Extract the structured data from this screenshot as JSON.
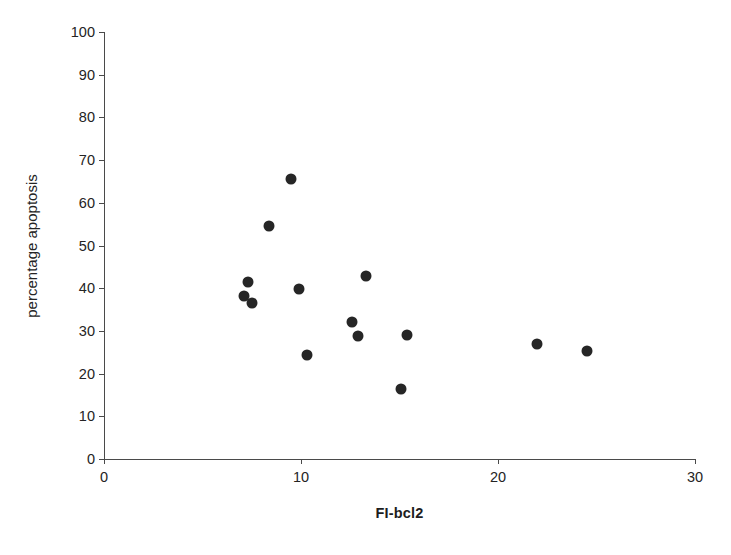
{
  "chart_data": {
    "type": "scatter",
    "title": "",
    "xlabel": "FI-bcl2",
    "ylabel": "percentage apoptosis",
    "xlim": [
      0,
      30
    ],
    "ylim": [
      0,
      100
    ],
    "xticks": [
      0,
      10,
      20,
      30
    ],
    "yticks": [
      0,
      10,
      20,
      30,
      40,
      50,
      60,
      70,
      80,
      90,
      100
    ],
    "xtick_labels": [
      "0",
      "10",
      "20",
      "30"
    ],
    "ytick_labels": [
      "0",
      "10",
      "20",
      "30",
      "40",
      "50",
      "60",
      "70",
      "80",
      "90",
      "100"
    ],
    "grid": false,
    "legend": false,
    "marker": "filled-circle",
    "marker_color": "#262626",
    "axis_color": "#4a4a4a",
    "series": [
      {
        "name": "samples",
        "points": [
          {
            "x": 7.3,
            "y": 41.5
          },
          {
            "x": 7.1,
            "y": 38.2
          },
          {
            "x": 7.5,
            "y": 36.6
          },
          {
            "x": 8.4,
            "y": 54.6
          },
          {
            "x": 9.5,
            "y": 65.5
          },
          {
            "x": 9.9,
            "y": 39.8
          },
          {
            "x": 10.3,
            "y": 24.4
          },
          {
            "x": 12.6,
            "y": 32.1
          },
          {
            "x": 12.9,
            "y": 28.7
          },
          {
            "x": 13.3,
            "y": 42.8
          },
          {
            "x": 15.1,
            "y": 16.3
          },
          {
            "x": 15.4,
            "y": 29.1
          },
          {
            "x": 22.0,
            "y": 26.9
          },
          {
            "x": 24.5,
            "y": 25.4
          }
        ]
      }
    ]
  }
}
